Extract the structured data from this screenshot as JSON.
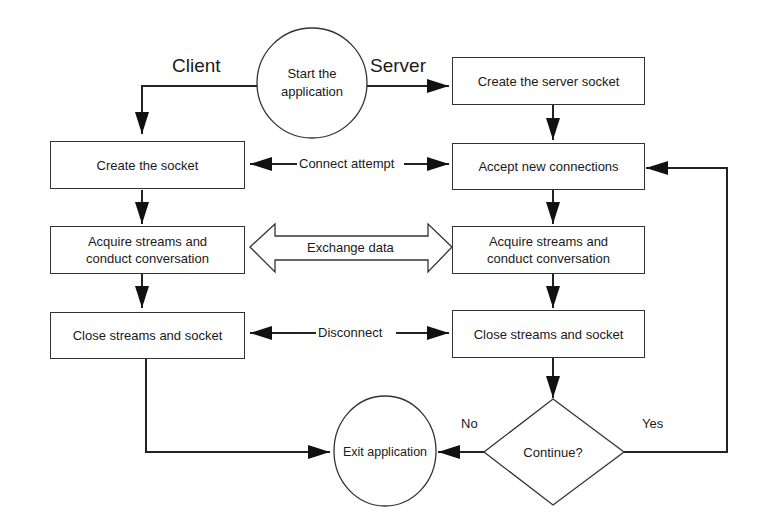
{
  "diagram": {
    "title_left": "Client",
    "title_right": "Server",
    "start": "Start the application",
    "start_line1": "Start the",
    "start_line2": "application",
    "client": {
      "create_socket": "Create the socket",
      "acquire_line1": "Acquire streams and",
      "acquire_line2": "conduct conversation",
      "close": "Close streams and socket"
    },
    "server": {
      "create_server_socket": "Create the server socket",
      "accept": "Accept new connections",
      "acquire_line1": "Acquire streams and",
      "acquire_line2": "conduct conversation",
      "close": "Close streams and socket"
    },
    "links": {
      "connect": "Connect attempt",
      "exchange": "Exchange data",
      "disconnect": "Disconnect"
    },
    "decision": "Continue?",
    "decision_no": "No",
    "decision_yes": "Yes",
    "exit": "Exit application"
  }
}
